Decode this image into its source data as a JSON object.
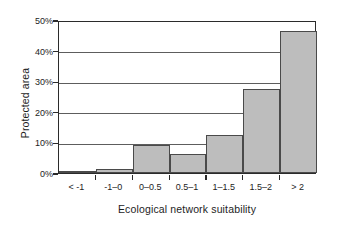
{
  "chart_data": {
    "type": "bar",
    "title": "",
    "subtitle": "",
    "xlabel": "Ecological network suitability",
    "ylabel": "Protected area",
    "categories": [
      "< -1",
      "-1–0",
      "0–0.5",
      "0.5–1",
      "1–1.5",
      "1.5–2",
      "> 2"
    ],
    "values": [
      0.4,
      1.2,
      9.0,
      6.3,
      12.4,
      27.5,
      46.5
    ],
    "value_unit": "%",
    "ylim": [
      0,
      50
    ],
    "ytick_values": [
      0,
      10,
      20,
      30,
      40,
      50
    ],
    "ytick_labels": [
      "0%",
      "10%",
      "20%",
      "30%",
      "40%",
      "50%"
    ],
    "grid": "horizontal",
    "legend": "none",
    "series": [
      {
        "name": "Protected area",
        "values": [
          0.4,
          1.2,
          9.0,
          6.3,
          12.4,
          27.5,
          46.5
        ]
      }
    ],
    "colors": {
      "bar_fill": "#bdbdbd",
      "bar_border": "#4a4a4a",
      "axis": "#2b2b2b",
      "gridline": "#5d5d5d",
      "plot_background": "#ffffff",
      "text": "#1d1d1d"
    }
  }
}
